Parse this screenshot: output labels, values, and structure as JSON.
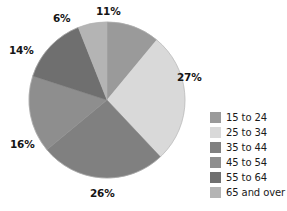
{
  "chart_data": {
    "type": "pie",
    "title": "",
    "subtitle": "",
    "xlabel": "",
    "ylabel": "",
    "grid": false,
    "legend_position": "right",
    "units": "percent",
    "total": 100,
    "start_angle_deg": 0,
    "direction": "clockwise",
    "categories": [
      "15 to 24",
      "25 to 34",
      "35 to 44",
      "45 to 54",
      "55 to 64",
      "65 and over"
    ],
    "values": [
      11,
      27,
      26,
      16,
      14,
      6
    ],
    "data_labels": [
      "11%",
      "27%",
      "26%",
      "16%",
      "14%",
      "6%"
    ],
    "colors": [
      "#9a9a9a",
      "#d9d9d9",
      "#808080",
      "#8e8e8e",
      "#6f6f6f",
      "#b4b4b4"
    ],
    "slices": [
      {
        "label": "15 to 24",
        "value": 11,
        "data_label": "11%",
        "color": "#9a9a9a"
      },
      {
        "label": "25 to 34",
        "value": 27,
        "data_label": "27%",
        "color": "#d9d9d9"
      },
      {
        "label": "35 to 44",
        "value": 26,
        "data_label": "26%",
        "color": "#808080"
      },
      {
        "label": "45 to 54",
        "value": 16,
        "data_label": "16%",
        "color": "#8e8e8e"
      },
      {
        "label": "55 to 64",
        "value": 14,
        "data_label": "14%",
        "color": "#6f6f6f"
      },
      {
        "label": "65 and over",
        "value": 6,
        "data_label": "6%",
        "color": "#b4b4b4"
      }
    ]
  },
  "legend": {
    "items": [
      {
        "label": "15 to 24",
        "color": "#9a9a9a"
      },
      {
        "label": "25 to 34",
        "color": "#d9d9d9"
      },
      {
        "label": "35 to 44",
        "color": "#808080"
      },
      {
        "label": "45 to 54",
        "color": "#8e8e8e"
      },
      {
        "label": "55 to 64",
        "color": "#6f6f6f"
      },
      {
        "label": "65 and over",
        "color": "#b4b4b4"
      }
    ]
  },
  "geometry": {
    "center_x": 107,
    "center_y": 100,
    "radius": 78
  }
}
